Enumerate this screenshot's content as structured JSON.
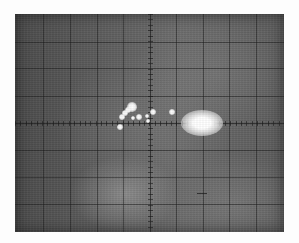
{
  "image": {
    "subject": "oscilloscope CRT screen with graticule",
    "width": 299,
    "height": 243,
    "background_color": "#fdfdfd"
  },
  "screen": {
    "left": 15,
    "top": 14,
    "width": 269,
    "height": 218,
    "base_color_dark": "#4a4a4a",
    "base_color_light": "#858585",
    "grid": {
      "vertical_divisions": 10,
      "horizontal_divisions": 8,
      "vertical_lines_x": [
        28,
        55,
        82,
        108,
        135,
        161,
        188,
        214,
        241
      ],
      "horizontal_lines_y": [
        28,
        54,
        82,
        109,
        136,
        163,
        190
      ],
      "center_axis_x": 135,
      "center_axis_y": 109,
      "line_color": "#1e1e1e"
    },
    "bright_spot": {
      "x": 187,
      "y": 109,
      "rx": 13,
      "ry": 8,
      "color": "#ffffff"
    },
    "dots": [
      {
        "x": 117,
        "y": 93,
        "r": 3
      },
      {
        "x": 113,
        "y": 96,
        "r": 2
      },
      {
        "x": 110,
        "y": 99,
        "r": 2
      },
      {
        "x": 107,
        "y": 103,
        "r": 2
      },
      {
        "x": 118,
        "y": 104,
        "r": 1.5
      },
      {
        "x": 124,
        "y": 103,
        "r": 2
      },
      {
        "x": 132,
        "y": 102,
        "r": 1.5
      },
      {
        "x": 138,
        "y": 98,
        "r": 2
      },
      {
        "x": 157,
        "y": 98,
        "r": 2
      },
      {
        "x": 133,
        "y": 107,
        "r": 1.5
      },
      {
        "x": 105,
        "y": 113,
        "r": 2
      }
    ],
    "dash": {
      "x": 182,
      "y": 179,
      "width": 10
    }
  }
}
